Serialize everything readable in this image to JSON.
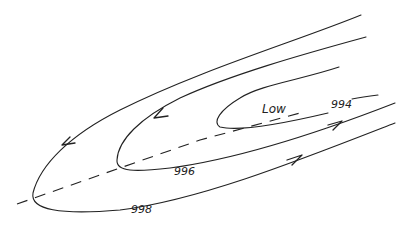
{
  "diagram": {
    "type": "isobar-trough",
    "center_label": "Low",
    "isobars": [
      {
        "value": "994",
        "label": "994"
      },
      {
        "value": "996",
        "label": "996"
      },
      {
        "value": "998",
        "label": "998"
      }
    ],
    "trough_axis": "dashed",
    "colors": {
      "ink": "#222222",
      "background": "#ffffff"
    }
  }
}
